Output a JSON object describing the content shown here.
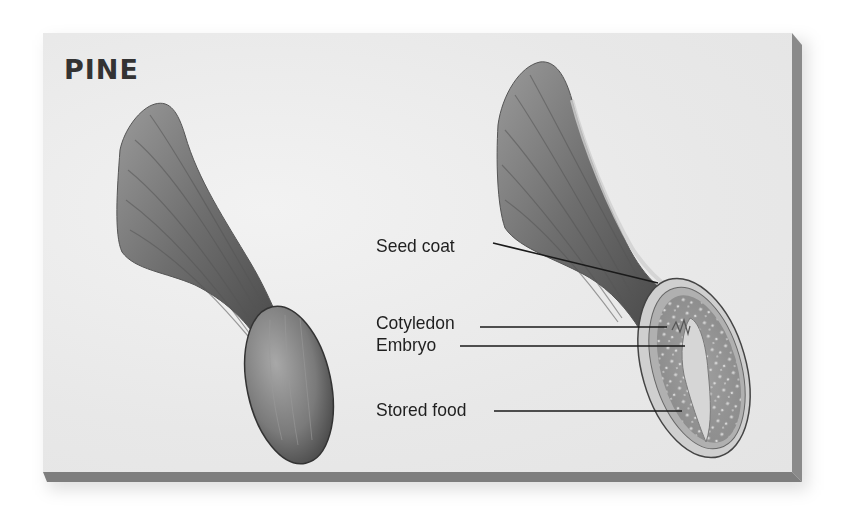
{
  "title": "PINE",
  "diagram": {
    "figures": [
      {
        "name": "whole-seed",
        "description": "Winged pine seed, exterior view"
      },
      {
        "name": "seed-cross-section",
        "description": "Winged pine seed, cut open to show interior"
      }
    ],
    "labels": [
      {
        "text": "Seed coat"
      },
      {
        "text": "Cotyledon"
      },
      {
        "text": "Embryo"
      },
      {
        "text": "Stored food"
      }
    ]
  },
  "colors": {
    "panel": "#ebebeb",
    "bevel": "#808080",
    "title": "#333333",
    "label_text": "#1f1f1f",
    "leader_line": "#1a1a1a"
  }
}
